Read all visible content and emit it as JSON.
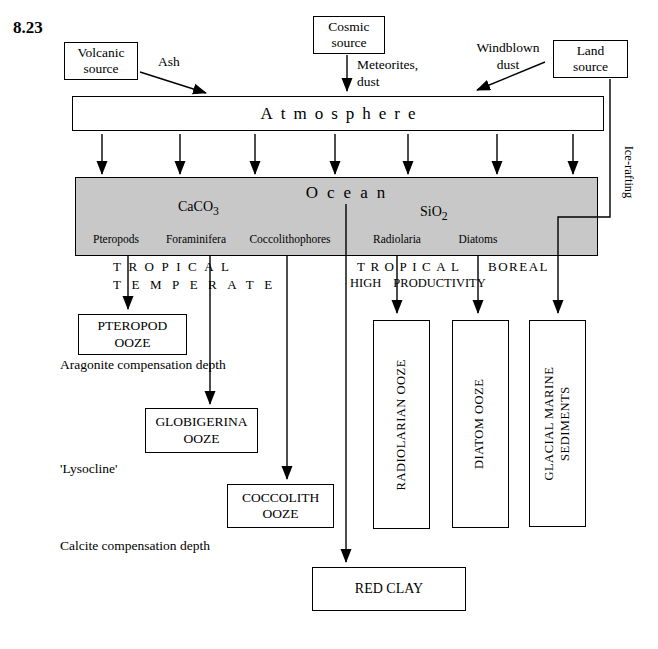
{
  "figure_label": "8.23",
  "colors": {
    "ocean_fill": "#c8c8c8",
    "line": "#000000",
    "background": "#ffffff"
  },
  "sources": {
    "volcanic": {
      "lines": [
        "Volcanic",
        "source"
      ]
    },
    "cosmic": {
      "lines": [
        "Cosmic",
        "source"
      ]
    },
    "land": {
      "lines": [
        "Land",
        "source"
      ]
    }
  },
  "flows": {
    "ash": "Ash",
    "meteorites": {
      "lines": [
        "Meteorites,",
        "dust"
      ]
    },
    "windblown": {
      "lines": [
        "Windblown",
        "dust"
      ]
    },
    "ice_rafting": "Ice-rafting"
  },
  "atmosphere": {
    "label": "Atmosphere"
  },
  "ocean": {
    "label": "Ocean",
    "minerals": {
      "caco3": {
        "base": "CaCO",
        "sub": "3"
      },
      "sio2": {
        "base": "SiO",
        "sub": "2"
      }
    },
    "organisms": [
      "Pteropods",
      "Foraminifera",
      "Coccolithophores",
      "Radiolaria",
      "Diatoms"
    ]
  },
  "zones": {
    "tropical_left": "TROPICAL",
    "temperate": "TEMPERATE",
    "tropical_right": "TROPICAL",
    "high_productivity": "HIGH PRODUCTIVITY",
    "boreal": "BOREAL"
  },
  "depth_labels": {
    "aragonite": "Aragonite compensation depth",
    "lysocline": "'Lysocline'",
    "calcite": "Calcite compensation depth"
  },
  "sediments": {
    "pteropod": {
      "lines": [
        "PTEROPOD",
        "OOZE"
      ]
    },
    "globigerina": {
      "lines": [
        "GLOBIGERINA",
        "OOZE"
      ]
    },
    "coccolith": {
      "lines": [
        "COCCOLITH",
        "OOZE"
      ]
    },
    "red_clay": "RED CLAY",
    "radiolarian": "RADIOLARIAN OOZE",
    "diatom": "DIATOM OOZE",
    "glacial": {
      "lines": [
        "GLACIAL MARINE",
        "SEDIMENTS"
      ]
    }
  }
}
